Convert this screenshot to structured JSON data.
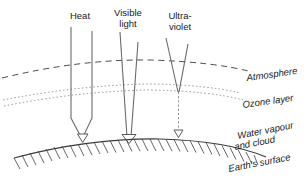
{
  "diagram": {
    "background_color": "#ffffff",
    "line_color": "#4a4a4a",
    "ray_color": "#6b6b6b",
    "width": 307,
    "height": 194
  },
  "beams": [
    {
      "id": "heat",
      "label_lines": [
        "Heat"
      ],
      "label_x": 80,
      "label_y": 19,
      "reaches_surface": true,
      "blocked_by_ozone": false
    },
    {
      "id": "visible-light",
      "label_lines": [
        "Visible",
        "light"
      ],
      "label_x": 128,
      "label_y": 16,
      "reaches_surface": true,
      "blocked_by_ozone": false
    },
    {
      "id": "ultra-violet",
      "label_lines": [
        "Ultra-",
        "violet"
      ],
      "label_x": 180,
      "label_y": 19,
      "reaches_surface": true,
      "blocked_by_ozone": true
    }
  ],
  "layers": [
    {
      "id": "atmosphere",
      "label": "Atmosphere",
      "style": "dashed",
      "label_x": 247,
      "label_y": 81,
      "label_rotation": -8
    },
    {
      "id": "ozone-layer",
      "label": "Ozone layer",
      "style": "dotted-band",
      "label_x": 243,
      "label_y": 108,
      "label_rotation": -8
    }
  ],
  "surface_labels": [
    {
      "id": "water-vapour",
      "lines": [
        "Water vapour",
        "and cloud"
      ],
      "label_x": 238,
      "label_y": 139,
      "label_rotation": -11
    },
    {
      "id": "earths-surface",
      "lines": [
        "Earth's surface"
      ],
      "label_x": 229,
      "label_y": 172,
      "label_rotation": -11
    }
  ]
}
